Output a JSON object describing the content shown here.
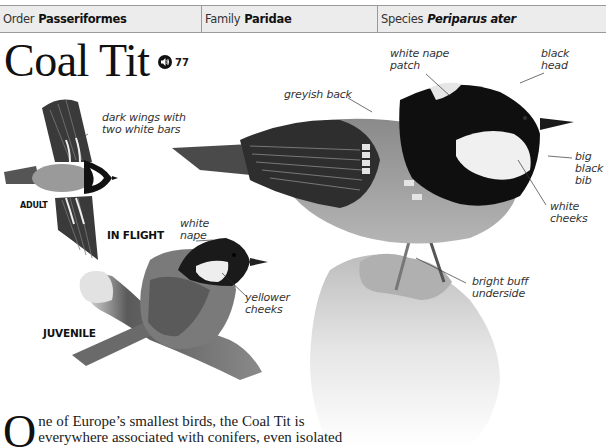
{
  "taxonomy": {
    "order": {
      "label": "Order",
      "value": "Passeriformes"
    },
    "family": {
      "label": "Family",
      "value": "Paridae"
    },
    "species": {
      "label": "Species",
      "value": "Periparus ater"
    }
  },
  "title": "Coal Tit",
  "audio": {
    "icon": "speaker-icon",
    "track": "77"
  },
  "flight": {
    "heading": "IN FLIGHT",
    "age_label": "ADULT",
    "annotation": [
      "dark wings with",
      "two white bars"
    ]
  },
  "juvenile": {
    "heading": "JUVENILE",
    "annotations": {
      "nape": [
        "white",
        "nape"
      ],
      "cheeks": [
        "yellower",
        "cheeks"
      ]
    }
  },
  "adult_annotations": {
    "nape_patch": [
      "white nape",
      "patch"
    ],
    "head": [
      "black",
      "head"
    ],
    "back": [
      "greyish back"
    ],
    "bib": [
      "big",
      "black",
      "bib"
    ],
    "cheeks": [
      "white",
      "cheeks"
    ],
    "underside": [
      "bright buff",
      "underside"
    ]
  },
  "body": {
    "dropcap": "O",
    "lines": [
      "ne of Europe’s smallest birds, the Coal Tit is",
      "everywhere associated with conifers, even isolated"
    ]
  },
  "colors": {
    "header_bg": "#ececec",
    "header_border": "#9a9a9a",
    "text": "#1a1a1a",
    "bird_black": "#111111",
    "bird_grey": "#6e6e6e",
    "bird_buff": "#c9c9c9"
  }
}
